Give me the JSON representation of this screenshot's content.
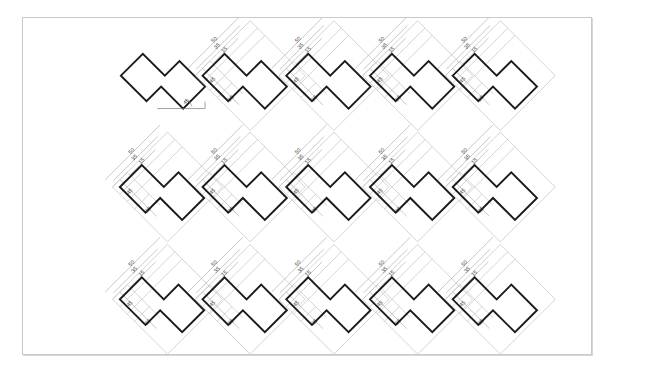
{
  "document": {
    "title": "Technical Drawing Sheet",
    "background_color": "#ffffff",
    "frame_color": "#c9c9c9"
  },
  "drawing": {
    "sheet_width": 570,
    "sheet_height": 338,
    "outline_color": "#1a1a1a",
    "dimension_color": "#b0b0b0",
    "text_color": "#3a3a3a",
    "grid": {
      "rows": 3,
      "columns": 5,
      "total_shapes": 15
    },
    "shape": {
      "name": "rotated-z-polygon",
      "rotation_degrees": 45,
      "vertex_count": 8
    },
    "dimensions": {
      "vertical_labels": [
        "50",
        "35",
        "15"
      ],
      "horizontal_labels": [
        "45",
        "25"
      ],
      "angle_label": "45"
    },
    "instances": [
      {
        "id": "shape-r1c1",
        "row": 1,
        "col": 1,
        "cx": 146,
        "cy": 58,
        "annotated": false,
        "angle_annotated": true
      },
      {
        "id": "shape-r1c2",
        "row": 1,
        "col": 2,
        "cx": 228,
        "cy": 58,
        "annotated": true,
        "angle_annotated": false
      },
      {
        "id": "shape-r1c3",
        "row": 1,
        "col": 3,
        "cx": 312,
        "cy": 58,
        "annotated": true,
        "angle_annotated": false
      },
      {
        "id": "shape-r1c4",
        "row": 1,
        "col": 4,
        "cx": 396,
        "cy": 58,
        "annotated": true,
        "angle_annotated": false
      },
      {
        "id": "shape-r1c5",
        "row": 1,
        "col": 5,
        "cx": 479,
        "cy": 58,
        "annotated": true,
        "angle_annotated": false
      },
      {
        "id": "shape-r2c1",
        "row": 2,
        "col": 1,
        "cx": 145,
        "cy": 170,
        "annotated": true,
        "angle_annotated": false
      },
      {
        "id": "shape-r2c2",
        "row": 2,
        "col": 2,
        "cx": 228,
        "cy": 170,
        "annotated": true,
        "angle_annotated": false
      },
      {
        "id": "shape-r2c3",
        "row": 2,
        "col": 3,
        "cx": 312,
        "cy": 170,
        "annotated": true,
        "angle_annotated": false
      },
      {
        "id": "shape-r2c4",
        "row": 2,
        "col": 4,
        "cx": 396,
        "cy": 170,
        "annotated": true,
        "angle_annotated": false
      },
      {
        "id": "shape-r2c5",
        "row": 2,
        "col": 5,
        "cx": 479,
        "cy": 170,
        "annotated": true,
        "angle_annotated": false
      },
      {
        "id": "shape-r3c1",
        "row": 3,
        "col": 1,
        "cx": 145,
        "cy": 283,
        "annotated": true,
        "angle_annotated": false
      },
      {
        "id": "shape-r3c2",
        "row": 3,
        "col": 2,
        "cx": 228,
        "cy": 283,
        "annotated": true,
        "angle_annotated": false
      },
      {
        "id": "shape-r3c3",
        "row": 3,
        "col": 3,
        "cx": 312,
        "cy": 283,
        "annotated": true,
        "angle_annotated": false
      },
      {
        "id": "shape-r3c4",
        "row": 3,
        "col": 4,
        "cx": 396,
        "cy": 283,
        "annotated": true,
        "angle_annotated": false
      },
      {
        "id": "shape-r3c5",
        "row": 3,
        "col": 5,
        "cx": 479,
        "cy": 283,
        "annotated": true,
        "angle_annotated": false
      }
    ]
  }
}
